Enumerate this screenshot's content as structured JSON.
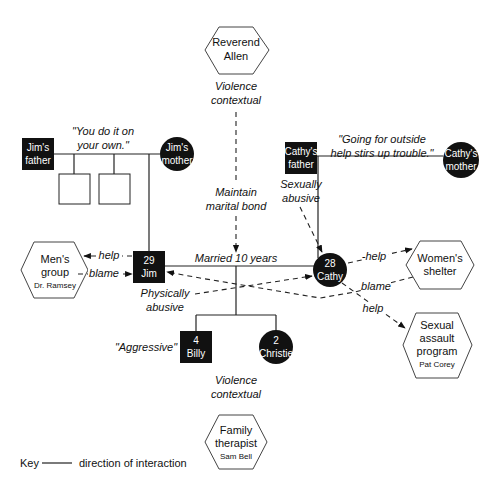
{
  "nodes": {
    "reverend": {
      "line1": "Reverend",
      "line2": "Allen"
    },
    "jims_father": {
      "line1": "Jim's",
      "line2": "father"
    },
    "jims_mother": {
      "line1": "Jim's",
      "line2": "mother"
    },
    "cathys_father": {
      "line1": "Cathy's",
      "line2": "father"
    },
    "cathys_mother": {
      "line1": "Cathy's",
      "line2": "mother"
    },
    "jim": {
      "age": "29",
      "name": "Jim"
    },
    "cathy": {
      "age": "28",
      "name": "Cathy"
    },
    "billy": {
      "age": "4",
      "name": "Billy"
    },
    "christie": {
      "age": "2",
      "name": "Christie"
    },
    "mens_group": {
      "line1": "Men's",
      "line2": "group",
      "line3": "Dr. Ramsey"
    },
    "womens_shelter": {
      "line1": "Women's",
      "line2": "shelter"
    },
    "sexual_assault": {
      "line1": "Sexual",
      "line2": "assault",
      "line3": "program",
      "line4": "Pat Corey"
    },
    "family_therapist": {
      "line1": "Family",
      "line2": "therapist",
      "line3": "Sam Bell"
    }
  },
  "labels": {
    "violence_top": {
      "line1": "Violence",
      "line2": "contextual"
    },
    "jim_family_quote": {
      "line1": "\"You do it on",
      "line2": "your own.\""
    },
    "cathy_family_quote": {
      "line1": "\"Going for outside",
      "line2": "help stirs up trouble.\""
    },
    "sexually_abusive": {
      "line1": "Sexually",
      "line2": "abusive"
    },
    "maintain_bond": {
      "line1": "Maintain",
      "line2": "marital bond"
    },
    "married": "Married 10 years",
    "physically_abusive": {
      "line1": "Physically",
      "line2": "abusive"
    },
    "aggressive": "\"Aggressive\"",
    "violence_bottom": {
      "line1": "Violence",
      "line2": "contextual"
    },
    "mens_help": "help",
    "mens_blame": "blame",
    "cathy_help_shelter": "-help",
    "shelter_blame": "blame",
    "cathy_help_assault": "help"
  },
  "key": {
    "label": "Key",
    "description": "direction of interaction"
  }
}
